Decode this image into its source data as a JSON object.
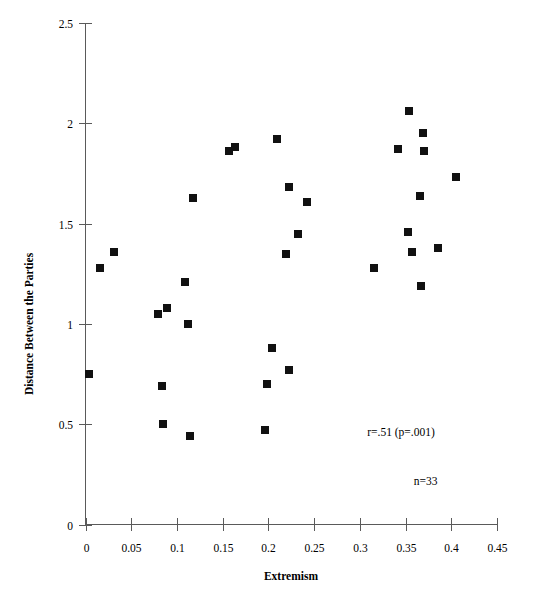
{
  "chart_data": {
    "type": "scatter",
    "title": "",
    "xlabel": "Extremism",
    "ylabel": "Distance Between the Parties",
    "xlim": [
      0,
      0.45
    ],
    "ylim": [
      0,
      2.5
    ],
    "xticks": [
      0,
      0.05,
      0.1,
      0.15,
      0.2,
      0.25,
      0.3,
      0.35,
      0.4,
      0.45
    ],
    "xtick_labels": [
      "0",
      "0.05",
      "0.1",
      "0.15",
      "0.2",
      "0.25",
      "0.3",
      "0.35",
      "0.4",
      "0.45"
    ],
    "yticks": [
      0,
      0.5,
      1,
      1.5,
      2,
      2.5
    ],
    "ytick_labels": [
      "0",
      "0.5",
      "1",
      "1.5",
      "2",
      "2.5"
    ],
    "grid": false,
    "legend": "none",
    "marker": "square",
    "marker_color": "#111111",
    "marker_size": 8,
    "points": [
      {
        "x": 0.004,
        "y": 0.75
      },
      {
        "x": 0.016,
        "y": 1.28
      },
      {
        "x": 0.031,
        "y": 1.36
      },
      {
        "x": 0.079,
        "y": 1.05
      },
      {
        "x": 0.084,
        "y": 0.69
      },
      {
        "x": 0.085,
        "y": 0.5
      },
      {
        "x": 0.089,
        "y": 1.08
      },
      {
        "x": 0.109,
        "y": 1.21
      },
      {
        "x": 0.112,
        "y": 1.0
      },
      {
        "x": 0.114,
        "y": 0.44
      },
      {
        "x": 0.118,
        "y": 1.63
      },
      {
        "x": 0.157,
        "y": 1.86
      },
      {
        "x": 0.163,
        "y": 1.88
      },
      {
        "x": 0.196,
        "y": 0.47
      },
      {
        "x": 0.198,
        "y": 0.7
      },
      {
        "x": 0.204,
        "y": 0.88
      },
      {
        "x": 0.209,
        "y": 1.92
      },
      {
        "x": 0.219,
        "y": 1.35
      },
      {
        "x": 0.222,
        "y": 0.77
      },
      {
        "x": 0.223,
        "y": 1.68
      },
      {
        "x": 0.232,
        "y": 1.45
      },
      {
        "x": 0.242,
        "y": 1.61
      },
      {
        "x": 0.316,
        "y": 1.28
      },
      {
        "x": 0.342,
        "y": 1.87
      },
      {
        "x": 0.353,
        "y": 1.46
      },
      {
        "x": 0.354,
        "y": 2.06
      },
      {
        "x": 0.357,
        "y": 1.36
      },
      {
        "x": 0.366,
        "y": 1.64
      },
      {
        "x": 0.367,
        "y": 1.19
      },
      {
        "x": 0.369,
        "y": 1.95
      },
      {
        "x": 0.37,
        "y": 1.86
      },
      {
        "x": 0.386,
        "y": 1.38
      },
      {
        "x": 0.405,
        "y": 1.73
      }
    ],
    "annotations": [
      {
        "id": "correlation",
        "text": "r=.51   (p=.001)",
        "x": 0.345,
        "y": 0.44
      },
      {
        "id": "sample-size",
        "text": "n=33",
        "x": 0.372,
        "y": 0.195
      }
    ]
  }
}
